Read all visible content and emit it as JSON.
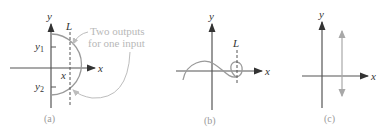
{
  "figure": {
    "panels": [
      {
        "id": "a",
        "caption": "(a)",
        "axis_x_label": "x",
        "axis_y_label": "y",
        "line_label": "L",
        "tick_labels": {
          "y1": "y",
          "y1_sub": "1",
          "y2": "y",
          "y2_sub": "2",
          "x": "x"
        },
        "annotation": {
          "line1": "Two outputs",
          "line2": "for one input"
        }
      },
      {
        "id": "b",
        "caption": "(b)",
        "axis_x_label": "x",
        "axis_y_label": "y",
        "line_label": "L"
      },
      {
        "id": "c",
        "caption": "(c)",
        "axis_x_label": "x",
        "axis_y_label": "y"
      }
    ],
    "colors": {
      "axis": "#555555",
      "curve": "#9a9a9a",
      "dashed": "#555555",
      "annotation": "#b8b8b8",
      "vertical_arrow": "#a8a8a8"
    }
  }
}
